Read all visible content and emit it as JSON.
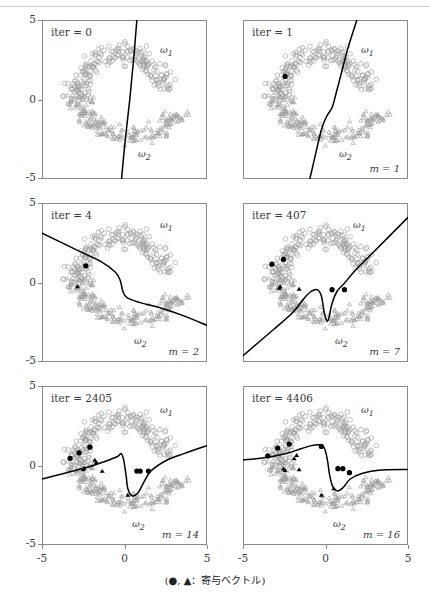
{
  "figure": {
    "caption": "(●, ▲：寄与ベクトル)",
    "caption_symbols": "(●, ▲",
    "caption_sep": "：",
    "caption_text": "寄与ベクトル)",
    "axis": {
      "x_ticks": [
        "-5",
        "0",
        "5"
      ],
      "y_ticks": [
        "5",
        "0",
        "-5"
      ],
      "xlim": [
        -5,
        5
      ],
      "ylim": [
        -5,
        5
      ]
    },
    "class_labels": {
      "class1": "ω1",
      "class2": "ω2"
    },
    "colors": {
      "boundary": "#000000",
      "support_vector": "#000000",
      "data_point": "#9a9a9a",
      "box": "#8a8a8a"
    },
    "panels": [
      {
        "id": "panel-iter-0",
        "iter_label": "iter = 0",
        "m_label": "",
        "w1": "ω1",
        "w2": "ω2"
      },
      {
        "id": "panel-iter-1",
        "iter_label": "iter = 1",
        "m_label": "m = 1",
        "w1": "ω1",
        "w2": "ω2"
      },
      {
        "id": "panel-iter-4",
        "iter_label": "iter = 4",
        "m_label": "m = 2",
        "w1": "ω1",
        "w2": "ω2"
      },
      {
        "id": "panel-iter-407",
        "iter_label": "iter = 407",
        "m_label": "m = 7",
        "w1": "ω1",
        "w2": "ω2"
      },
      {
        "id": "panel-iter-2405",
        "iter_label": "iter = 2405",
        "m_label": "m = 14",
        "w1": "ω1",
        "w2": "ω2"
      },
      {
        "id": "panel-iter-4406",
        "iter_label": "iter = 4406",
        "m_label": "m = 16",
        "w1": "ω1",
        "w2": "ω2"
      }
    ]
  },
  "chart_data": {
    "type": "scatter",
    "title": "",
    "xlabel": "",
    "ylabel": "",
    "xlim": [
      -5,
      5
    ],
    "ylim": [
      -5,
      5
    ],
    "grid": false,
    "legend": "(●, ▲：寄与ベクトル)",
    "series": [
      {
        "name": "ω1",
        "marker": "circle-open",
        "color": "#9a9a9a",
        "count": 200
      },
      {
        "name": "ω2",
        "marker": "triangle-open",
        "color": "#9a9a9a",
        "count": 200
      },
      {
        "name": "寄与ベクトル ω1",
        "marker": "circle-filled",
        "color": "#000000"
      },
      {
        "name": "寄与ベクトル ω2",
        "marker": "triangle-filled",
        "color": "#000000"
      }
    ],
    "panels": [
      {
        "iter": 0,
        "m": 0,
        "boundary": [
          [
            0.75,
            5.0
          ],
          [
            0.55,
            2.5
          ],
          [
            0.32,
            0.0
          ],
          [
            0.05,
            -2.5
          ],
          [
            -0.18,
            -5.0
          ]
        ],
        "support_circles": [],
        "support_triangles": []
      },
      {
        "iter": 1,
        "m": 1,
        "boundary": [
          [
            1.9,
            5.0
          ],
          [
            1.35,
            3.2
          ],
          [
            0.95,
            1.6
          ],
          [
            0.62,
            0.3
          ],
          [
            0.4,
            -0.5
          ],
          [
            0.05,
            -1.1
          ],
          [
            -0.25,
            -1.9
          ],
          [
            -0.55,
            -3.2
          ],
          [
            -0.95,
            -5.0
          ]
        ],
        "support_circles": [
          [
            -2.45,
            1.45
          ]
        ],
        "support_triangles": []
      },
      {
        "iter": 4,
        "m": 2,
        "boundary": [
          [
            -5.0,
            3.1
          ],
          [
            -3.0,
            2.1
          ],
          [
            -1.4,
            1.3
          ],
          [
            -0.55,
            0.65
          ],
          [
            -0.25,
            0.1
          ],
          [
            -0.1,
            -0.55
          ],
          [
            0.15,
            -0.95
          ],
          [
            0.9,
            -1.25
          ],
          [
            2.2,
            -1.6
          ],
          [
            3.6,
            -2.1
          ],
          [
            5.0,
            -2.7
          ]
        ],
        "support_circles": [
          [
            -2.35,
            1.05
          ]
        ],
        "support_triangles": [
          [
            -2.85,
            -0.25
          ]
        ]
      },
      {
        "iter": 407,
        "m": 7,
        "boundary": [
          [
            -5.0,
            -4.6
          ],
          [
            -3.2,
            -3.0
          ],
          [
            -2.0,
            -1.9
          ],
          [
            -1.3,
            -1.0
          ],
          [
            -0.85,
            -0.55
          ],
          [
            -0.5,
            -0.45
          ],
          [
            -0.25,
            -0.85
          ],
          [
            -0.05,
            -2.0
          ],
          [
            0.15,
            -2.4
          ],
          [
            0.4,
            -1.3
          ],
          [
            0.7,
            -0.55
          ],
          [
            1.1,
            -0.1
          ],
          [
            1.8,
            0.75
          ],
          [
            2.9,
            1.9
          ],
          [
            5.0,
            4.1
          ]
        ],
        "support_circles": [
          [
            -3.25,
            1.15
          ],
          [
            -2.55,
            1.45
          ],
          [
            0.4,
            -0.45
          ],
          [
            1.15,
            -0.45
          ]
        ],
        "support_triangles": [
          [
            -2.8,
            -0.35
          ],
          [
            -2.75,
            -0.25
          ],
          [
            -1.6,
            -0.4
          ]
        ]
      },
      {
        "iter": 2405,
        "m": 14,
        "boundary": [
          [
            -5.0,
            -0.85
          ],
          [
            -3.5,
            -0.45
          ],
          [
            -2.2,
            -0.1
          ],
          [
            -1.2,
            0.25
          ],
          [
            -0.45,
            0.55
          ],
          [
            -0.2,
            0.75
          ],
          [
            -0.05,
            0.35
          ],
          [
            0.1,
            -0.65
          ],
          [
            0.2,
            -1.45
          ],
          [
            0.45,
            -1.9
          ],
          [
            0.8,
            -1.75
          ],
          [
            1.2,
            -1.0
          ],
          [
            1.6,
            -0.35
          ],
          [
            2.5,
            0.3
          ],
          [
            3.6,
            0.75
          ],
          [
            5.0,
            1.25
          ]
        ],
        "support_circles": [
          [
            -3.3,
            0.45
          ],
          [
            -2.75,
            0.8
          ],
          [
            -2.1,
            1.15
          ],
          [
            0.75,
            -0.35
          ],
          [
            0.95,
            -0.35
          ],
          [
            1.45,
            -0.35
          ]
        ],
        "support_triangles": [
          [
            -1.8,
            0.35
          ],
          [
            -1.7,
            0.2
          ],
          [
            -2.5,
            -0.25
          ],
          [
            -2.45,
            -0.15
          ],
          [
            -1.35,
            -0.35
          ],
          [
            0.2,
            -1.85
          ]
        ]
      },
      {
        "iter": 4406,
        "m": 16,
        "boundary": [
          [
            -5.0,
            0.35
          ],
          [
            -3.6,
            0.5
          ],
          [
            -2.4,
            0.75
          ],
          [
            -1.5,
            1.05
          ],
          [
            -0.85,
            1.25
          ],
          [
            -0.4,
            1.3
          ],
          [
            -0.1,
            1.15
          ],
          [
            0.1,
            0.45
          ],
          [
            0.25,
            -0.6
          ],
          [
            0.45,
            -1.35
          ],
          [
            0.75,
            -1.6
          ],
          [
            1.1,
            -1.35
          ],
          [
            1.5,
            -0.85
          ],
          [
            2.2,
            -0.5
          ],
          [
            3.2,
            -0.3
          ],
          [
            5.0,
            -0.25
          ]
        ],
        "support_circles": [
          [
            -3.5,
            0.6
          ],
          [
            -2.9,
            1.1
          ],
          [
            -2.2,
            1.35
          ],
          [
            -0.25,
            1.2
          ],
          [
            0.75,
            -0.2
          ],
          [
            1.05,
            -0.2
          ],
          [
            1.45,
            -0.45
          ]
        ],
        "support_triangles": [
          [
            -1.75,
            0.65
          ],
          [
            -1.9,
            0.45
          ],
          [
            -2.55,
            -0.2
          ],
          [
            -2.45,
            -0.3
          ],
          [
            -1.6,
            -0.25
          ],
          [
            0.5,
            -1.45
          ],
          [
            -0.25,
            -1.85
          ]
        ]
      }
    ]
  }
}
